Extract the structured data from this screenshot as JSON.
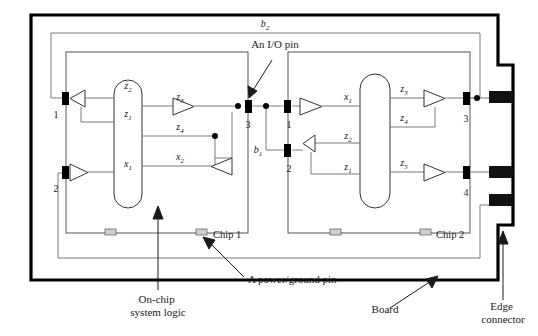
{
  "diagram": {
    "colors": {
      "board_outline": "#000000",
      "trace": "#7a7a7a",
      "chip_outline": "#555555",
      "pin_fill": "#000000",
      "text": "#1a1a1a",
      "pg_pin_fill": "#cfcfcf",
      "background": "#ffffff"
    },
    "bus_labels": {
      "b2": "b",
      "b2_sub": "2",
      "b1": "b",
      "b1_sub": "1"
    },
    "annotations": [
      {
        "id": "io-pin",
        "text": "An I/O pin"
      },
      {
        "id": "on-chip-logic",
        "line1": "On-chip",
        "line2": "system logic"
      },
      {
        "id": "power-ground",
        "text": "A power/ground pin"
      },
      {
        "id": "board",
        "text": "Board"
      },
      {
        "id": "edge-connector",
        "line1": "Edge",
        "line2": "connector"
      }
    ],
    "chips": [
      {
        "id": "chip1",
        "name": "Chip 1",
        "pins_left": [
          {
            "num": "1"
          },
          {
            "num": "2"
          }
        ],
        "pins_right": [
          {
            "num": "3"
          }
        ],
        "signals_in": [
          {
            "name": "z",
            "sub": "2"
          },
          {
            "name": "z",
            "sub": "1"
          },
          {
            "name": "x",
            "sub": "1"
          }
        ],
        "signals_out": [
          {
            "name": "z",
            "sub": "3"
          },
          {
            "name": "z",
            "sub": "4"
          },
          {
            "name": "x",
            "sub": "2"
          }
        ]
      },
      {
        "id": "chip2",
        "name": "Chip 2",
        "pins_left": [
          {
            "num": "1"
          },
          {
            "num": "2"
          }
        ],
        "pins_right": [
          {
            "num": "3"
          },
          {
            "num": "4"
          }
        ],
        "signals_in": [
          {
            "name": "x",
            "sub": "1"
          },
          {
            "name": "z",
            "sub": "2"
          },
          {
            "name": "z",
            "sub": "1"
          }
        ],
        "signals_out": [
          {
            "name": "z",
            "sub": "3"
          },
          {
            "name": "z",
            "sub": "4"
          },
          {
            "name": "z",
            "sub": "5"
          }
        ]
      }
    ]
  }
}
